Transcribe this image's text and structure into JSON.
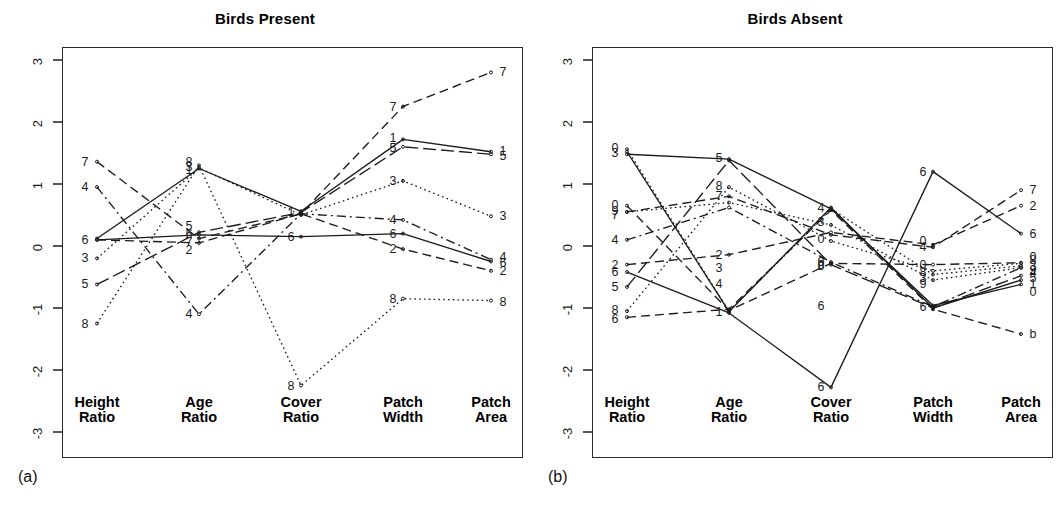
{
  "figure": {
    "background": "#ffffff",
    "ink_color": "#1b1b1b"
  },
  "panels": [
    {
      "id": "a",
      "tag": "(a)",
      "title": "Birds Present"
    },
    {
      "id": "b",
      "tag": "(b)",
      "title": "Birds Absent"
    }
  ],
  "axis_ticks": [
    "3",
    "2",
    "1",
    "0",
    "-1",
    "-2",
    "-3"
  ],
  "axis_names": [
    {
      "line1": "Height",
      "line2": "Ratio"
    },
    {
      "line1": "Age",
      "line2": "Ratio"
    },
    {
      "line1": "Cover",
      "line2": "Ratio"
    },
    {
      "line1": "Patch",
      "line2": "Width"
    },
    {
      "line1": "Patch",
      "line2": "Area"
    }
  ],
  "chart_data": [
    {
      "type": "line",
      "subtype": "parallel-coordinates",
      "title": "Birds Present",
      "panel_tag": "(a)",
      "xlabel": "",
      "ylabel": "",
      "ylim": [
        -3.3,
        3.3
      ],
      "yticks": [
        3,
        2,
        1,
        0,
        -1,
        -2,
        -3
      ],
      "grid": false,
      "legend": "none",
      "categories": [
        "Height Ratio",
        "Age Ratio",
        "Cover Ratio",
        "Patch Width",
        "Patch Area"
      ],
      "series": [
        {
          "name": "1",
          "linestyle": "solid",
          "values": [
            0.12,
            1.25,
            0.56,
            1.72,
            1.52
          ]
        },
        {
          "name": "2",
          "linestyle": "dashed",
          "values": [
            0.1,
            0.05,
            0.52,
            -0.05,
            -0.4
          ]
        },
        {
          "name": "3",
          "linestyle": "dotted",
          "values": [
            -0.2,
            1.26,
            0.5,
            1.05,
            0.48
          ]
        },
        {
          "name": "4",
          "linestyle": "dashdot",
          "values": [
            0.95,
            -1.1,
            0.52,
            0.42,
            -0.22
          ]
        },
        {
          "name": "5",
          "linestyle": "longdash",
          "values": [
            -0.62,
            0.22,
            0.54,
            1.6,
            1.48
          ]
        },
        {
          "name": "6",
          "linestyle": "solid",
          "values": [
            0.1,
            0.18,
            0.15,
            0.2,
            -0.25
          ]
        },
        {
          "name": "7",
          "linestyle": "dashed",
          "values": [
            1.36,
            0.12,
            0.52,
            2.25,
            2.8
          ]
        },
        {
          "name": "8",
          "linestyle": "dotted",
          "values": [
            -1.25,
            1.3,
            -2.25,
            -0.85,
            -0.88
          ]
        }
      ]
    },
    {
      "type": "line",
      "subtype": "parallel-coordinates",
      "title": "Birds Absent",
      "panel_tag": "(b)",
      "xlabel": "",
      "ylabel": "",
      "ylim": [
        -3.3,
        3.3
      ],
      "yticks": [
        3,
        2,
        1,
        0,
        -1,
        -2,
        -3
      ],
      "grid": false,
      "legend": "none",
      "categories": [
        "Height Ratio",
        "Age Ratio",
        "Cover Ratio",
        "Patch Width",
        "Patch Area"
      ],
      "series": [
        {
          "name": "1",
          "linestyle": "solid",
          "values": [
            1.52,
            -1.06,
            0.62,
            -1.0,
            -0.55
          ]
        },
        {
          "name": "2",
          "linestyle": "dashed",
          "values": [
            -0.3,
            -0.14,
            0.22,
            0.02,
            0.65
          ]
        },
        {
          "name": "3",
          "linestyle": "dotted",
          "values": [
            1.56,
            -1.05,
            0.6,
            -0.46,
            -0.32
          ]
        },
        {
          "name": "4",
          "linestyle": "dashdot",
          "values": [
            0.1,
            0.62,
            -0.26,
            -0.98,
            -0.35
          ]
        },
        {
          "name": "5",
          "linestyle": "longdash",
          "values": [
            -0.66,
            1.38,
            -0.3,
            -1.0,
            -0.48
          ]
        },
        {
          "name": "6",
          "linestyle": "solid",
          "values": [
            -0.42,
            -1.08,
            -2.28,
            1.2,
            0.2
          ]
        },
        {
          "name": "7",
          "linestyle": "dashed",
          "values": [
            0.55,
            0.8,
            0.18,
            -0.02,
            0.9
          ]
        },
        {
          "name": "8",
          "linestyle": "dotted",
          "values": [
            -1.05,
            0.95,
            0.08,
            -0.4,
            -0.28
          ]
        },
        {
          "name": "9",
          "linestyle": "dotted",
          "values": [
            0.55,
            0.7,
            0.34,
            -0.55,
            -0.35
          ]
        },
        {
          "name": "0",
          "linestyle": "dashed",
          "values": [
            0.65,
            -1.04,
            -0.28,
            -0.3,
            -0.27
          ]
        },
        {
          "name": "b",
          "linestyle": "dashed",
          "values": [
            -1.15,
            -1.02,
            0.58,
            -1.02,
            -1.42
          ]
        },
        {
          "name": "a",
          "linestyle": "solid",
          "values": [
            1.48,
            1.4,
            0.6,
            -0.96,
            -0.62
          ]
        }
      ]
    }
  ],
  "point_labels": {
    "panel_a": {
      "axis1": [
        {
          "text": "7",
          "value": 1.36
        },
        {
          "text": "4",
          "value": 0.95
        },
        {
          "text": "6",
          "value": 0.1
        },
        {
          "text": "3",
          "value": -0.2
        },
        {
          "text": "5",
          "value": -0.62
        },
        {
          "text": "8",
          "value": -1.25
        }
      ],
      "axis2": [
        {
          "text": "8",
          "value": 1.36
        },
        {
          "text": "3",
          "value": 1.27
        },
        {
          "text": "1",
          "value": 1.22
        },
        {
          "text": "5",
          "value": 0.33
        },
        {
          "text": "6",
          "value": 0.2
        },
        {
          "text": "7",
          "value": 0.07
        },
        {
          "text": "2",
          "value": -0.06
        },
        {
          "text": "4",
          "value": -1.1
        }
      ],
      "axis3": [
        {
          "text": "1",
          "value": 0.55
        },
        {
          "text": "6",
          "value": 0.15
        },
        {
          "text": "8",
          "value": -2.25
        }
      ],
      "axis4": [
        {
          "text": "7",
          "value": 2.25
        },
        {
          "text": "1",
          "value": 1.74
        },
        {
          "text": "5",
          "value": 1.58
        },
        {
          "text": "3",
          "value": 1.05
        },
        {
          "text": "4",
          "value": 0.42
        },
        {
          "text": "6",
          "value": 0.2
        },
        {
          "text": "2",
          "value": -0.05
        },
        {
          "text": "8",
          "value": -0.85
        }
      ],
      "axis5": [
        {
          "text": "7",
          "value": 2.8
        },
        {
          "text": "1",
          "value": 1.54
        },
        {
          "text": "5",
          "value": 1.45
        },
        {
          "text": "3",
          "value": 0.48
        },
        {
          "text": "4",
          "value": -0.18
        },
        {
          "text": "6",
          "value": -0.28
        },
        {
          "text": "2",
          "value": -0.4
        },
        {
          "text": "8",
          "value": -0.9
        }
      ]
    },
    "panel_b": {
      "axis1": [
        {
          "text": "0",
          "value": 1.58
        },
        {
          "text": "3",
          "value": 1.5
        },
        {
          "text": "0",
          "value": 0.66
        },
        {
          "text": "9",
          "value": 0.56
        },
        {
          "text": "7",
          "value": 0.5
        },
        {
          "text": "4",
          "value": 0.1
        },
        {
          "text": "2",
          "value": -0.3
        },
        {
          "text": "6",
          "value": -0.42
        },
        {
          "text": "5",
          "value": -0.66
        },
        {
          "text": "8",
          "value": -1.04
        },
        {
          "text": "6",
          "value": -1.18
        }
      ],
      "axis2": [
        {
          "text": "5",
          "value": 1.42
        },
        {
          "text": "8",
          "value": 0.96
        },
        {
          "text": "7",
          "value": 0.8
        },
        {
          "text": "2",
          "value": -0.14
        },
        {
          "text": "3",
          "value": -0.35
        },
        {
          "text": "4",
          "value": -0.62
        },
        {
          "text": "1",
          "value": -1.06
        }
      ],
      "axis3": [
        {
          "text": "4",
          "value": 0.62
        },
        {
          "text": "3",
          "value": 0.38
        },
        {
          "text": "0",
          "value": 0.12
        },
        {
          "text": "9",
          "value": -0.25
        },
        {
          "text": "0",
          "value": -0.3
        },
        {
          "text": "8",
          "value": -0.32
        },
        {
          "text": "6",
          "value": -0.96
        },
        {
          "text": "6",
          "value": -2.28
        }
      ],
      "axis4": [
        {
          "text": "6",
          "value": 1.2
        },
        {
          "text": "0",
          "value": 0.08
        },
        {
          "text": "4",
          "value": -0.02
        },
        {
          "text": "0",
          "value": -0.3
        },
        {
          "text": "8",
          "value": -0.42
        },
        {
          "text": "3",
          "value": -0.52
        },
        {
          "text": "9",
          "value": -0.62
        },
        {
          "text": "6",
          "value": -0.98
        }
      ],
      "axis5": [
        {
          "text": "7",
          "value": 0.9
        },
        {
          "text": "2",
          "value": 0.65
        },
        {
          "text": "6",
          "value": 0.2
        },
        {
          "text": "0",
          "value": -0.18
        },
        {
          "text": "8",
          "value": -0.22
        },
        {
          "text": "3",
          "value": -0.32
        },
        {
          "text": "9",
          "value": -0.38
        },
        {
          "text": "4",
          "value": -0.44
        },
        {
          "text": "5",
          "value": -0.52
        },
        {
          "text": "1",
          "value": -0.62
        },
        {
          "text": "0",
          "value": -0.74
        },
        {
          "text": "b",
          "value": -1.42
        }
      ]
    }
  }
}
